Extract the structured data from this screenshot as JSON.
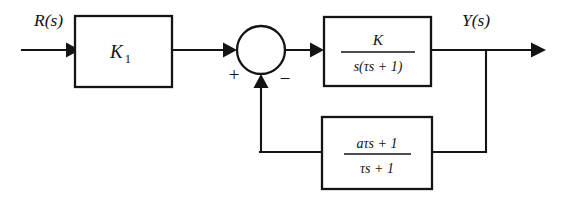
{
  "diagram": {
    "type": "control-system-block-diagram",
    "stroke_color": "#141414",
    "background_color": "#ffffff",
    "signals": {
      "input_label": "R(s)",
      "output_label": "Y(s)"
    },
    "blocks": [
      {
        "id": "gain",
        "name": "forward-gain-block",
        "label": "K",
        "subscript": "1",
        "kind": "gain"
      },
      {
        "id": "plant",
        "name": "plant-transfer-function-block",
        "kind": "transfer-function",
        "numerator": "K",
        "denominator": "s(τs + 1)",
        "denominator_parts": {
          "lead": "s(",
          "tau": "τ",
          "middle": "s + 1",
          "close": ")"
        }
      },
      {
        "id": "feedback",
        "name": "feedback-compensator-block",
        "kind": "transfer-function",
        "numerator": "aτs + 1",
        "denominator": "τs + 1",
        "numerator_parts": {
          "a": "a",
          "tau": "τ",
          "rest": "s + 1"
        },
        "denominator_parts": {
          "tau": "τ",
          "rest": "s + 1"
        }
      }
    ],
    "summing_junction": {
      "name": "summing-junction",
      "positive_sign": "+",
      "negative_sign": "−",
      "positive_input": "forward path from gain block",
      "negative_input": "feedback path"
    }
  }
}
